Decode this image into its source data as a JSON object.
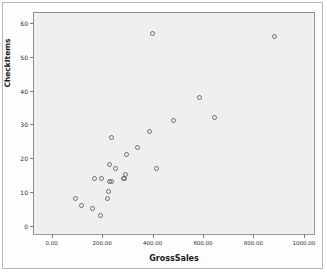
{
  "chart_data": {
    "type": "scatter",
    "title": "",
    "xlabel": "GrossSales",
    "ylabel": "CheckItems",
    "xlim": [
      -70,
      1040
    ],
    "ylim": [
      -2.5,
      63
    ],
    "grid": false,
    "legend": null,
    "marker": {
      "shape": "open-circle",
      "edge_color": "#6d6d6d",
      "fill": "none",
      "size_px": 5
    },
    "panel_background": "#efefef",
    "xticks": [
      0,
      200,
      400,
      600,
      800,
      1000
    ],
    "xtick_labels": [
      "0.00",
      "200.00",
      "400.00",
      "600.00",
      "800.00",
      "1000.00"
    ],
    "yticks": [
      0,
      10,
      20,
      30,
      40,
      50,
      60
    ],
    "ytick_labels": [
      "0",
      "10",
      "20",
      "30",
      "40",
      "50",
      "60"
    ],
    "points": [
      {
        "x": 95,
        "y": 8
      },
      {
        "x": 120,
        "y": 6
      },
      {
        "x": 160,
        "y": 5
      },
      {
        "x": 168,
        "y": 14
      },
      {
        "x": 192,
        "y": 3
      },
      {
        "x": 196,
        "y": 14
      },
      {
        "x": 222,
        "y": 8
      },
      {
        "x": 224,
        "y": 10
      },
      {
        "x": 228,
        "y": 13
      },
      {
        "x": 230,
        "y": 18
      },
      {
        "x": 236,
        "y": 13
      },
      {
        "x": 238,
        "y": 26
      },
      {
        "x": 252,
        "y": 17
      },
      {
        "x": 285,
        "y": 14
      },
      {
        "x": 290,
        "y": 14
      },
      {
        "x": 292,
        "y": 15
      },
      {
        "x": 296,
        "y": 21
      },
      {
        "x": 340,
        "y": 23
      },
      {
        "x": 388,
        "y": 28
      },
      {
        "x": 400,
        "y": 57
      },
      {
        "x": 415,
        "y": 17
      },
      {
        "x": 483,
        "y": 31
      },
      {
        "x": 585,
        "y": 38
      },
      {
        "x": 645,
        "y": 32
      },
      {
        "x": 885,
        "y": 56
      }
    ]
  }
}
